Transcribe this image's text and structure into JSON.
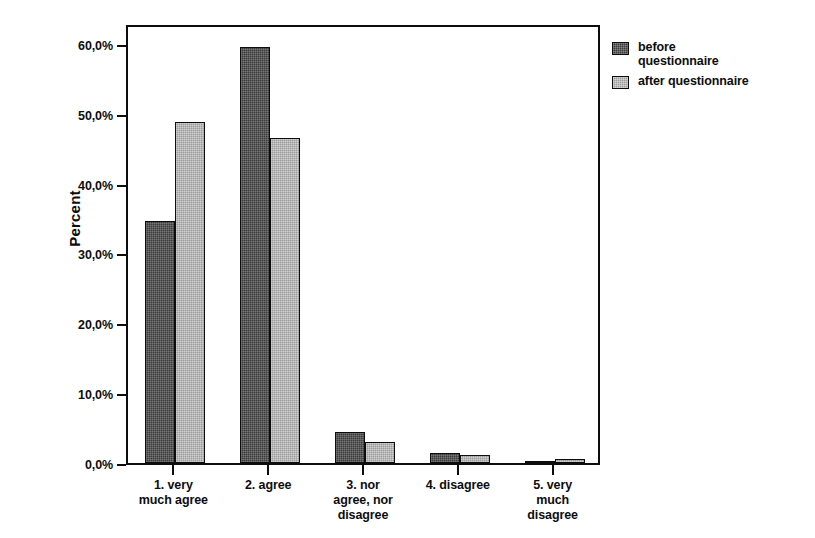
{
  "chart_data": {
    "type": "bar",
    "title": "",
    "subtitle": "",
    "xlabel": "",
    "ylabel": "Percent",
    "categories": [
      "1. very much agree",
      "2. agree",
      "3. nor agree, nor disagree",
      "4. disagree",
      "5. very much disagree"
    ],
    "category_lines": [
      [
        "1. very",
        "much agree"
      ],
      [
        "2. agree"
      ],
      [
        "3. nor",
        "agree, nor",
        "disagree"
      ],
      [
        "4. disagree"
      ],
      [
        "5. very",
        "much",
        "disagree"
      ]
    ],
    "series": [
      {
        "name": "before questionnaire",
        "name_lines": [
          "before",
          "questionnaire"
        ],
        "color": "#3b3b3b",
        "values": [
          34.7,
          59.6,
          4.4,
          1.5,
          0.3
        ]
      },
      {
        "name": "after questionnaire",
        "name_lines": [
          "after questionnaire"
        ],
        "color": "#9b9b9b",
        "values": [
          48.8,
          46.6,
          3.0,
          1.1,
          0.6
        ]
      }
    ],
    "ylim": [
      0,
      63
    ],
    "y_ticks": [
      0,
      10,
      20,
      30,
      40,
      50,
      60
    ],
    "y_tick_labels": [
      "0,0%",
      "10,0%",
      "20,0%",
      "30,0%",
      "40,0%",
      "50,0%",
      "60,0%"
    ],
    "grid": false,
    "legend_position": "right-top",
    "axis_color": "#0d0d0d",
    "background": "#ffffff"
  },
  "axis": {
    "y_title": "Percent"
  },
  "legend": {
    "items": [
      {
        "label": "before questionnaire",
        "line1": "before",
        "line2": "questionnaire"
      },
      {
        "label": "after questionnaire",
        "line1": "after questionnaire",
        "line2": ""
      }
    ]
  }
}
